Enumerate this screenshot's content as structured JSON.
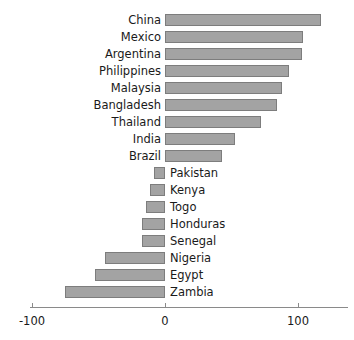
{
  "chart_data": {
    "type": "bar",
    "orientation": "horizontal",
    "title": "",
    "subtitle": "",
    "xlabel": "",
    "ylabel": "",
    "xlim": [
      -100,
      142
    ],
    "xticks": [
      -100,
      0,
      100
    ],
    "xtick_labels": [
      "-100",
      "0",
      "100"
    ],
    "grid": false,
    "legend": null,
    "categories": [
      "China",
      "Mexico",
      "Argentina",
      "Philippines",
      "Malaysia",
      "Bangladesh",
      "Thailand",
      "India",
      "Brazil",
      "Pakistan",
      "Kenya",
      "Togo",
      "Honduras",
      "Senegal",
      "Nigeria",
      "Egypt",
      "Zambia"
    ],
    "values": [
      117,
      104,
      103,
      93,
      88,
      84,
      72,
      53,
      43,
      -8,
      -11,
      -14,
      -17,
      -17,
      -45,
      -53,
      -75
    ],
    "bar_color": "#a3a3a3",
    "bar_border_color": "#7d7d7d",
    "axis_color": "#8a8a8a",
    "text_color": "#1a1a1a"
  }
}
